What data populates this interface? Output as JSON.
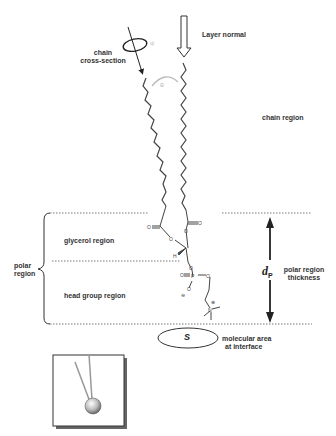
{
  "labels": {
    "layer_normal": "Layer normal",
    "chain_cross_line1": "chain",
    "chain_cross_line2": "cross-section",
    "chain_region": "chain region",
    "glycerol_region": "glycerol region",
    "head_group_region": "head group region",
    "polar_region_line1": "polar",
    "polar_region_line2": "region",
    "dp_symbol": "d",
    "dp_subscript": "P",
    "polar_thickness_line1": "polar region",
    "polar_thickness_line2": "thickness",
    "molecular_area_symbol": "S",
    "molecular_area_line1": "molecular area",
    "molecular_area_line2": "at interface",
    "tilt_angle_symbol": "Θ",
    "rotation_symbol": "ψ"
  },
  "molecule": {
    "atoms": {
      "oxygen": "O",
      "phosphorus": "P",
      "nitrogen": "N",
      "hydrogen": "H",
      "minus_charge": "⊖",
      "plus_charge": "⊕"
    }
  },
  "colors": {
    "line": "#333333",
    "dotted": "#555555",
    "tilt_arc": "#bbbbbb",
    "sphere_light": "#ffffff",
    "sphere_dark": "#777777"
  }
}
